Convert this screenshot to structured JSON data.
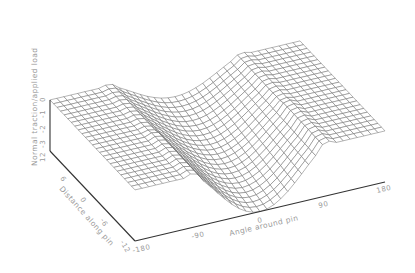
{
  "chart_data": {
    "type": "surface3d",
    "title": "",
    "xlabel": "Angle around pin",
    "ylabel": "Distance along pin",
    "zlabel": "Normal traction/applied load",
    "x_ticks": [
      "-180",
      "-90",
      "0",
      "90",
      "180"
    ],
    "y_ticks": [
      "-12",
      "-6",
      "0",
      "6",
      "12"
    ],
    "z_ticks": [
      "0",
      "-1",
      "-2",
      "-3"
    ],
    "xlim": [
      -180,
      180
    ],
    "ylim": [
      -12,
      12
    ],
    "zlim": [
      -3.7,
      0
    ],
    "grid": false,
    "legend": null,
    "surface_description": "Flat plane at z=0 outside contact arc; trough centered at angle 0 spanning roughly -90 to 90 degrees, peak depth about -3.7 near distance -12 edge, shallower toward +12 with a raised lip near the ends of the contact arc",
    "mesh": {
      "n_angle": 36,
      "n_dist": 24
    },
    "sample_points": [
      {
        "angle": -180,
        "distance": 0,
        "z": 0
      },
      {
        "angle": -90,
        "distance": 0,
        "z": 0
      },
      {
        "angle": -45,
        "distance": 0,
        "z": -1.9
      },
      {
        "angle": 0,
        "distance": 0,
        "z": -2.8
      },
      {
        "angle": 0,
        "distance": -12,
        "z": -3.7
      },
      {
        "angle": 0,
        "distance": 12,
        "z": -2.2
      },
      {
        "angle": 45,
        "distance": 0,
        "z": -1.9
      },
      {
        "angle": 90,
        "distance": 0,
        "z": 0
      },
      {
        "angle": 180,
        "distance": 0,
        "z": 0
      }
    ]
  },
  "axes": {
    "z_axis_title": "Normal traction/applied load",
    "y_axis_title": "Distance along pin",
    "x_axis_title": "Angle around pin"
  }
}
